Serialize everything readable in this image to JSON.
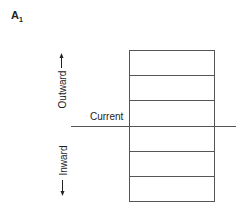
{
  "panel": {
    "label": "A",
    "subscript": "1"
  },
  "labels": {
    "outward": "Outward",
    "inward": "Inward",
    "current": "Current"
  },
  "diagram": {
    "box": {
      "x": 129,
      "y": 50,
      "width": 85,
      "height": 151
    },
    "row_lines_y": [
      75,
      100,
      151,
      176
    ],
    "current_line": {
      "x1": 71,
      "x2": 236,
      "y": 126
    },
    "line_color": "#555555"
  }
}
